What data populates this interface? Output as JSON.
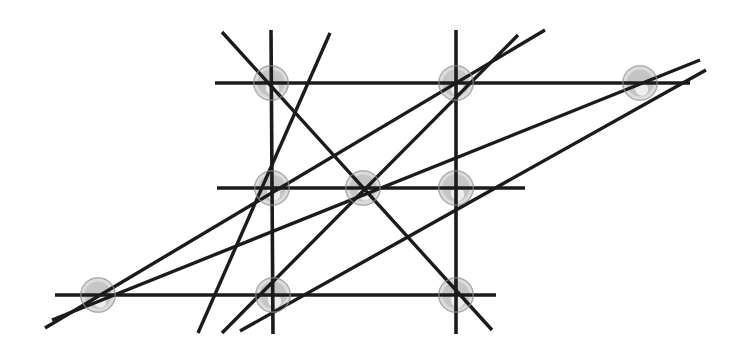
{
  "figure": {
    "kind": "incidence-geometry-diagram",
    "canvas": {
      "width": 742,
      "height": 360,
      "background": "#ffffff"
    },
    "style": {
      "line_color": "#1b1b1b",
      "grid_line_width": 3.6,
      "diagonal_line_width": 3.4,
      "node_halo_color": "#b9b9b9",
      "node_ring_color": "#9a9a9a",
      "node_radius": 18
    },
    "points": [
      {
        "id": "p1",
        "label": "top-left",
        "x": 271,
        "y": 83
      },
      {
        "id": "p2",
        "label": "top-middle",
        "x": 456,
        "y": 83
      },
      {
        "id": "p3",
        "label": "top-right-outer",
        "x": 640,
        "y": 83
      },
      {
        "id": "p4",
        "label": "middle-left",
        "x": 272,
        "y": 188
      },
      {
        "id": "p5",
        "label": "center",
        "x": 363,
        "y": 188
      },
      {
        "id": "p6",
        "label": "middle-right",
        "x": 456,
        "y": 188
      },
      {
        "id": "p7",
        "label": "bottom-left-outer",
        "x": 98,
        "y": 295
      },
      {
        "id": "p8",
        "label": "bottom-middle",
        "x": 273,
        "y": 295
      },
      {
        "id": "p9",
        "label": "bottom-right",
        "x": 456,
        "y": 295
      }
    ],
    "grid_lines": [
      {
        "id": "h-top",
        "orientation": "horizontal",
        "x1": 215,
        "y1": 83,
        "x2": 690,
        "y2": 83,
        "through": [
          "p1",
          "p2",
          "p3"
        ]
      },
      {
        "id": "h-middle",
        "orientation": "horizontal",
        "x1": 217,
        "y1": 188,
        "x2": 525,
        "y2": 188,
        "through": [
          "p4",
          "p5",
          "p6"
        ]
      },
      {
        "id": "h-bottom",
        "orientation": "horizontal",
        "x1": 55,
        "y1": 295,
        "x2": 496,
        "y2": 295,
        "through": [
          "p7",
          "p8",
          "p9"
        ]
      },
      {
        "id": "v-left",
        "orientation": "vertical",
        "x1": 271,
        "y1": 30,
        "x2": 273,
        "y2": 334,
        "through": [
          "p1",
          "p4",
          "p8"
        ]
      },
      {
        "id": "v-right",
        "orientation": "vertical",
        "x1": 456,
        "y1": 30,
        "x2": 456,
        "y2": 334,
        "through": [
          "p2",
          "p6",
          "p9"
        ]
      }
    ],
    "diagonal_lines": [
      {
        "id": "d1",
        "x1": 222,
        "y1": 32,
        "x2": 492,
        "y2": 330,
        "through": [
          "p1",
          "p5",
          "p9"
        ]
      },
      {
        "id": "d2",
        "x1": 45,
        "y1": 328,
        "x2": 545,
        "y2": 30,
        "through": [
          "p7",
          "p4",
          "p2"
        ]
      },
      {
        "id": "d3",
        "x1": 52,
        "y1": 320,
        "x2": 700,
        "y2": 60,
        "through": [
          "p7",
          "p5",
          "p3"
        ]
      },
      {
        "id": "d4",
        "x1": 222,
        "y1": 333,
        "x2": 518,
        "y2": 35,
        "through": [
          "p8",
          "p5",
          "p2"
        ]
      },
      {
        "id": "d5",
        "x1": 240,
        "y1": 331,
        "x2": 706,
        "y2": 70,
        "through": [
          "p8",
          "p6",
          "p3"
        ]
      },
      {
        "id": "d6",
        "x1": 198,
        "y1": 333,
        "x2": 330,
        "y2": 33,
        "through": [
          "p8",
          "p1"
        ]
      }
    ]
  }
}
